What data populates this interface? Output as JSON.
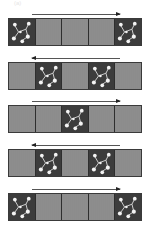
{
  "figure": {
    "label": "(a)",
    "colors": {
      "light_cell": "#8c8c8c",
      "dark_cell": "#3c3c3c",
      "molecule": "#ffffff",
      "border": "#2e2e2e",
      "arrow": "#333333"
    },
    "rows": [
      {
        "arrow_direction": "right",
        "cells": [
          "dark",
          "light",
          "light",
          "light",
          "dark"
        ]
      },
      {
        "arrow_direction": "left",
        "cells": [
          "light",
          "dark",
          "light",
          "dark",
          "light"
        ]
      },
      {
        "arrow_direction": "right",
        "cells": [
          "light",
          "light",
          "dark",
          "light",
          "light"
        ]
      },
      {
        "arrow_direction": "left",
        "cells": [
          "light",
          "dark",
          "light",
          "dark",
          "light"
        ]
      },
      {
        "arrow_direction": "right",
        "cells": [
          "dark",
          "light",
          "light",
          "light",
          "dark"
        ]
      }
    ]
  }
}
